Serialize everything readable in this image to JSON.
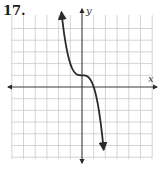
{
  "problem": {
    "number": "17."
  },
  "colors": {
    "grid": "#c9c9c9",
    "axis": "#3a3a3a",
    "curve": "#2a2a2a",
    "text": "#1a1a1a"
  },
  "chart_data": {
    "type": "line",
    "title": "17.",
    "xlabel": "x",
    "ylabel": "y",
    "grid": true,
    "tick_labels": false,
    "unit_px": 11.7,
    "origin_px": [
      82,
      87
    ],
    "xlim": [
      -6,
      6
    ],
    "ylim": [
      -6,
      6.5
    ],
    "legend": null,
    "series": [
      {
        "name": "f(x)",
        "description": "cubic curve, decreasing, with horizontal inflection at (0, 1); appears to be y = 1 - x^3",
        "inflection_point": [
          0,
          1
        ],
        "x_intercept": 1,
        "arrows_both_ends": true,
        "x": [
          -1.75,
          -1.5,
          -1.25,
          -1.0,
          -0.75,
          -0.5,
          -0.25,
          0,
          0.25,
          0.5,
          0.75,
          1.0,
          1.25,
          1.5,
          1.75,
          1.85
        ],
        "y": [
          6.36,
          4.38,
          2.95,
          2.0,
          1.42,
          1.13,
          1.02,
          1.0,
          0.98,
          0.88,
          0.58,
          0.0,
          -0.95,
          -2.38,
          -4.36,
          -5.33
        ]
      }
    ]
  }
}
